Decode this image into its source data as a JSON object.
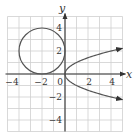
{
  "chart_data": {
    "type": "line",
    "title": "",
    "xlabel": "x",
    "ylabel": "y",
    "xlim": [
      -5,
      5
    ],
    "ylim": [
      -5,
      5
    ],
    "grid": true,
    "x_ticks": [
      -4,
      -2,
      0,
      2,
      4
    ],
    "y_ticks": [
      4,
      2,
      -2,
      -4
    ],
    "x_tick_labels": [
      "−4",
      "−2",
      "0",
      "2",
      "4"
    ],
    "y_tick_labels": [
      "4",
      "2",
      "−2",
      "−4"
    ],
    "series": [
      {
        "name": "circle",
        "shape": "circle",
        "center": [
          -2,
          2
        ],
        "radius": 2,
        "equation": "(x+2)^2 + (y-2)^2 = 4"
      },
      {
        "name": "parabola",
        "shape": "parabola",
        "equation": "x = y^2",
        "x_range": [
          0,
          5
        ],
        "points": [
          [
            5,
            -2.236
          ],
          [
            4,
            -2
          ],
          [
            1,
            -1
          ],
          [
            0,
            0
          ],
          [
            1,
            1
          ],
          [
            4,
            2
          ],
          [
            5,
            2.236
          ]
        ],
        "arrows": true
      }
    ],
    "colors": {
      "grid": "#cfcfcf",
      "axis": "#333333",
      "curve": "#555555"
    }
  }
}
